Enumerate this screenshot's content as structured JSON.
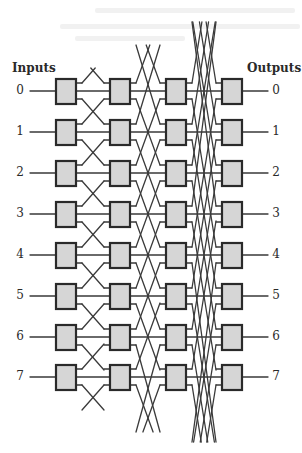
{
  "diagram": {
    "inputs_label": "Inputs",
    "outputs_label": "Outputs",
    "input_ports": [
      "0",
      "1",
      "2",
      "3",
      "4",
      "5",
      "6",
      "7"
    ],
    "output_ports": [
      "0",
      "1",
      "2",
      "3",
      "4",
      "5",
      "6",
      "7"
    ],
    "rows": 8,
    "stages": 4,
    "row_y": [
      91,
      132,
      173,
      214,
      255,
      296,
      337,
      377
    ],
    "column_x": [
      56,
      110,
      166,
      222
    ],
    "switch_width": 20,
    "switch_height": 25,
    "stage_shifts": [
      1,
      2,
      4
    ],
    "stage_wrap_extent": [
      [
        68,
        410
      ],
      [
        45,
        432
      ],
      [
        22,
        442
      ]
    ],
    "colors": {
      "line": "#3a3a3a",
      "switch_fill": "#d6d6d6",
      "switch_border": "#2a2a2a",
      "text": "#2a2a2a"
    }
  }
}
